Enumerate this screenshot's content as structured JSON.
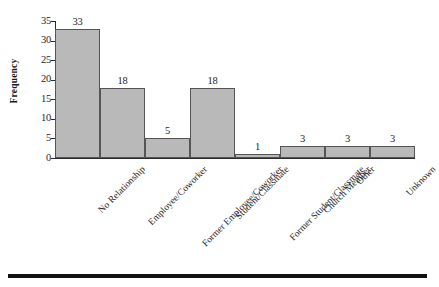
{
  "chart_data": {
    "type": "bar",
    "title": "",
    "subtitle": "",
    "xlabel": "",
    "ylabel": "Frequency",
    "categories": [
      "No Relationship",
      "Employee/Coworker",
      "Former Employee/Coworker",
      "Student/Classmate",
      "Former Student/Classmate",
      "Church Member",
      "Other",
      "Unknown"
    ],
    "values": [
      33,
      18,
      5,
      18,
      1,
      3,
      3,
      3
    ],
    "data_labels": [
      "33",
      "18",
      "5",
      "18",
      "1",
      "3",
      "3",
      "3"
    ],
    "ylim": [
      0,
      35
    ],
    "ytick_labels": [
      "0",
      "5",
      "10",
      "15",
      "20",
      "25",
      "30",
      "35"
    ],
    "ytick_values": [
      0,
      5,
      10,
      15,
      20,
      25,
      30,
      35
    ],
    "grid": false,
    "legend": null,
    "legend_position": "none",
    "bar_fill_color": "#b9b9b9",
    "bar_border_color": "#555555",
    "axis_color": "#2b2b2b",
    "text_color": "#262626",
    "background_color": "#ffffff",
    "xtick_label_rotation": -45
  },
  "figure": {
    "bottom_rule_color": "#111111"
  }
}
